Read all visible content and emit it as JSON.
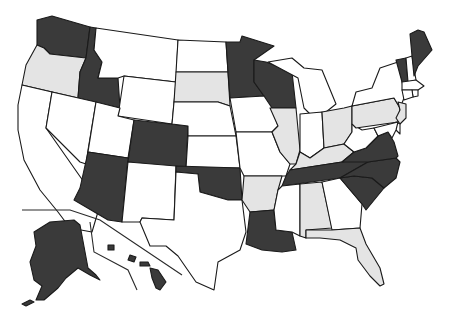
{
  "map": {
    "type": "US states choropleth",
    "categories": {
      "dark": {
        "color": "#3a3a3a"
      },
      "light": {
        "color": "#e4e4e4"
      },
      "white": {
        "color": "#ffffff"
      }
    },
    "states": {
      "WA": "dark",
      "OR": "light",
      "CA": "white",
      "ID": "dark",
      "NV": "white",
      "MT": "white",
      "WY": "white",
      "UT": "white",
      "AZ": "dark",
      "CO": "dark",
      "NM": "white",
      "ND": "white",
      "SD": "light",
      "NE": "white",
      "KS": "white",
      "OK": "dark",
      "TX": "white",
      "MN": "dark",
      "IA": "white",
      "MO": "white",
      "AR": "light",
      "LA": "dark",
      "WI": "dark",
      "IL": "light",
      "MI": "white",
      "IN": "white",
      "OH": "light",
      "KY": "light",
      "TN": "dark",
      "MS": "white",
      "AL": "light",
      "GA": "white",
      "FL": "light",
      "SC": "dark",
      "NC": "dark",
      "VA": "dark",
      "WV": "white",
      "PA": "light",
      "NY": "white",
      "VT": "dark",
      "NH": "white",
      "ME": "dark",
      "MA": "white",
      "RI": "white",
      "CT": "white",
      "NJ": "light",
      "DE": "white",
      "MD": "white",
      "AK": "dark",
      "HI": "dark"
    }
  }
}
